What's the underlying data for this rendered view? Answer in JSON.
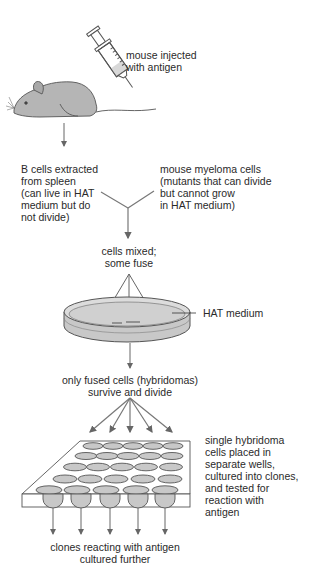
{
  "diagram": {
    "steps": {
      "injection": {
        "lines": [
          "mouse injected",
          "with antigen"
        ]
      },
      "b_cells": {
        "lines": [
          "B cells extracted",
          "from spleen",
          "(can live in HAT",
          "medium but do",
          "not divide)"
        ]
      },
      "myeloma": {
        "lines": [
          "mouse myeloma cells",
          "(mutants that can divide",
          "but cannot grow",
          "in HAT medium)"
        ]
      },
      "mixed": {
        "lines": [
          "cells mixed;",
          "some fuse"
        ]
      },
      "medium": {
        "label": "HAT medium"
      },
      "survive": {
        "lines": [
          "only fused cells (hybridomas)",
          "survive and divide"
        ]
      },
      "wells": {
        "lines": [
          "single hybridoma",
          "cells placed in",
          "separate wells,",
          "cultured into clones,",
          "and tested for",
          "reaction with",
          "antigen"
        ]
      },
      "final": {
        "lines": [
          "clones reacting with antigen",
          "cultured further"
        ]
      }
    },
    "colors": {
      "line": "#666666",
      "fill_gray": "#c8c8c8",
      "fill_light": "#e4e4e4",
      "text": "#2a2a2a"
    },
    "plate": {
      "rows": 5,
      "cols": 5
    }
  }
}
